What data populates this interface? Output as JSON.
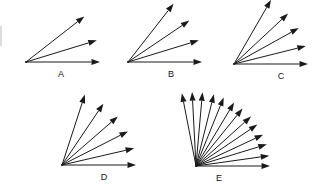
{
  "figure": {
    "background_color": "#ffffff",
    "stroke_color": "#1a1a1a",
    "label_color": "#111111",
    "width": 325,
    "height": 190
  },
  "edge_artifact": {
    "name": "left-edge-line",
    "x": 1,
    "y1": 26,
    "y2": 46,
    "color": "#b9b9b9"
  },
  "groups": [
    {
      "id": "A",
      "label": "A",
      "label_x": 61,
      "label_y": 75,
      "origin_x": 26,
      "origin_y": 62,
      "arrow_count": 3,
      "length": 74,
      "angles_deg": [
        0,
        17,
        38
      ]
    },
    {
      "id": "B",
      "label": "B",
      "label_x": 171,
      "label_y": 75,
      "origin_x": 128,
      "origin_y": 62,
      "arrow_count": 4,
      "length": 74,
      "angles_deg": [
        0,
        17,
        34,
        52
      ]
    },
    {
      "id": "C",
      "label": "C",
      "label_x": 281,
      "label_y": 77,
      "origin_x": 234,
      "origin_y": 64,
      "arrow_count": 5,
      "length": 74,
      "angles_deg": [
        0,
        14,
        29,
        43,
        60
      ]
    },
    {
      "id": "D",
      "label": "D",
      "label_x": 104,
      "label_y": 178,
      "origin_x": 62,
      "origin_y": 165,
      "arrow_count": 6,
      "length": 74,
      "angles_deg": [
        0,
        13,
        27,
        41,
        56,
        72
      ]
    },
    {
      "id": "E",
      "label": "E",
      "label_x": 219,
      "label_y": 179,
      "origin_x": 196,
      "origin_y": 166,
      "arrow_count": 13,
      "length": 74,
      "angles_deg": [
        0,
        8,
        17,
        25,
        34,
        42,
        51,
        59,
        68,
        76,
        85,
        93,
        101
      ]
    }
  ]
}
